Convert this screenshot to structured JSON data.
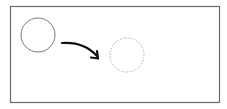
{
  "diagram": {
    "frame": {
      "stroke": "#6b6b6b"
    },
    "source_shape": {
      "type": "circle",
      "style": "solid",
      "stroke": "#7a7a7a"
    },
    "target_shape": {
      "type": "circle",
      "style": "dotted",
      "stroke": "#9a9a9a"
    },
    "arrow": {
      "style": "curved",
      "color": "#111111",
      "icon": "curved-arrow-icon"
    },
    "colors": {
      "background": "#ffffff"
    }
  }
}
